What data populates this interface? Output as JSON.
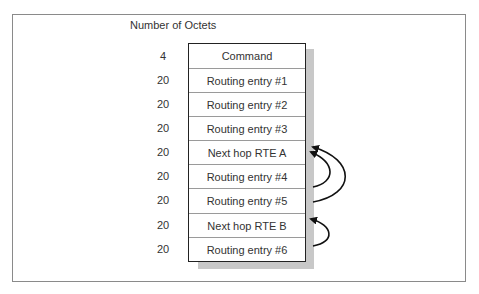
{
  "diagram": {
    "heading": "Number of Octets",
    "rows": [
      {
        "octets": "4",
        "label": "Command"
      },
      {
        "octets": "20",
        "label": "Routing entry #1"
      },
      {
        "octets": "20",
        "label": "Routing entry #2"
      },
      {
        "octets": "20",
        "label": "Routing entry #3"
      },
      {
        "octets": "20",
        "label": "Next hop RTE A"
      },
      {
        "octets": "20",
        "label": "Routing entry #4"
      },
      {
        "octets": "20",
        "label": "Routing entry #5"
      },
      {
        "octets": "20",
        "label": "Next hop RTE B"
      },
      {
        "octets": "20",
        "label": "Routing entry #6"
      }
    ],
    "arrows": [
      {
        "from": "Routing entry #4",
        "to": "Next hop RTE A"
      },
      {
        "from": "Routing entry #5",
        "to": "Next hop RTE A"
      },
      {
        "from": "Routing entry #6",
        "to": "Next hop RTE B"
      }
    ],
    "colors": {
      "border": "#222222",
      "shadow": "#c8c8c8",
      "divider": "#9a9a9a",
      "frame": "#8a8a8a"
    }
  }
}
